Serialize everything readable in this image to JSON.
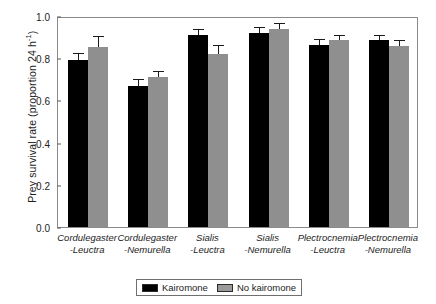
{
  "chart_data": {
    "type": "bar",
    "title": "",
    "xlabel": "",
    "ylabel": "Prey survival rate (proportion 24 h-1)",
    "ylabel_main": "Prey survival rate (proportion 24 h",
    "ylabel_sup": "-1",
    "ylabel_tail": ")",
    "ylim": [
      0.0,
      1.0
    ],
    "yticks": [
      "0.0",
      "0.2",
      "0.4",
      "0.6",
      "0.8",
      "1.0"
    ],
    "ytick_values": [
      0.0,
      0.2,
      0.4,
      0.6,
      0.8,
      1.0
    ],
    "grid": false,
    "legend_position": "bottom-center",
    "categories": [
      "Cordulegaster -Leuctra",
      "Cordulegaster -Nemurella",
      "Sialis -Leuctra",
      "Sialis -Nemurella",
      "Plectrocnemia -Leuctra",
      "Plectrocnemia -Nemurella"
    ],
    "category_lines": [
      {
        "line1": "Cordulegaster",
        "line2": "-Leuctra"
      },
      {
        "line1": "Cordulegaster",
        "line2": "-Nemurella"
      },
      {
        "line1": "Sialis",
        "line2": "-Leuctra"
      },
      {
        "line1": "Sialis",
        "line2": "-Nemurella"
      },
      {
        "line1": "Plectrocnemia",
        "line2": "-Leuctra"
      },
      {
        "line1": "Plectrocnemia",
        "line2": "-Nemurella"
      }
    ],
    "series": [
      {
        "name": "Kairomone",
        "color": "#000000",
        "values": [
          0.79,
          0.67,
          0.91,
          0.92,
          0.865,
          0.885
        ],
        "errors": [
          0.03,
          0.028,
          0.025,
          0.022,
          0.022,
          0.022
        ]
      },
      {
        "name": "No kairomone",
        "color": "#8f8f8f",
        "values": [
          0.855,
          0.71,
          0.82,
          0.94,
          0.885,
          0.86
        ],
        "errors": [
          0.045,
          0.025,
          0.04,
          0.02,
          0.022,
          0.022
        ]
      }
    ]
  },
  "legend": {
    "items": [
      {
        "label": "Kairomone",
        "color": "#000000"
      },
      {
        "label": "No kairomone",
        "color": "#9a9a9a"
      }
    ]
  },
  "colors": {
    "kairomone": "#000000",
    "no_kairomone": "#8f8f8f",
    "axis": "#8a8a8a",
    "text": "#1d1d1d"
  }
}
